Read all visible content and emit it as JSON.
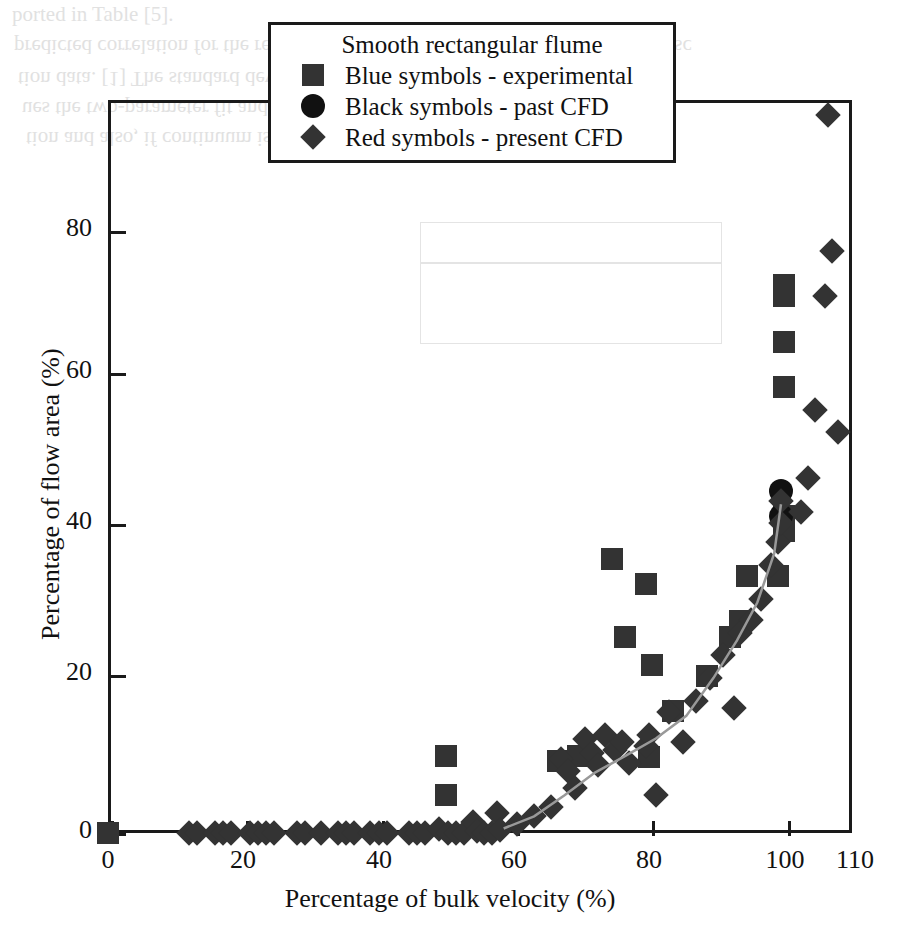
{
  "legend": {
    "title": "Smooth rectangular flume",
    "entries": [
      {
        "marker": "square",
        "label": "Blue symbols - experimental"
      },
      {
        "marker": "circle",
        "label": "Black symbols - past CFD"
      },
      {
        "marker": "diamond",
        "label": "Red symbols - present CFD"
      }
    ]
  },
  "background_text": {
    "line1": "ported in Table [5].",
    "line2": "predicted correlation for the rectangular flume. The nearly close results, albeit sc",
    "line3": "tion data. [1] The standard deviation and the best-fit correlation of the data",
    "line4": "ues the two-parameter fit and the second moment of the sample. Although",
    "line5": "tion and also, if continuum is used, the relative flux rate of the data matrix"
  },
  "chart_data": {
    "type": "scatter",
    "title": "",
    "xlabel": "Percentage of bulk velocity (%)",
    "ylabel": "Percentage of flow area (%)",
    "xlim": [
      0,
      110
    ],
    "ylim": [
      0,
      97
    ],
    "xticks": [
      0,
      20,
      40,
      60,
      80,
      100,
      110
    ],
    "yticks": [
      0,
      20,
      40,
      60,
      80
    ],
    "grid": false,
    "legend_position": "top-center",
    "series": [
      {
        "name": "Blue symbols - experimental",
        "marker": "square",
        "color": "#333333",
        "points": [
          [
            0,
            0
          ],
          [
            50,
            10.2
          ],
          [
            50,
            5.0
          ],
          [
            66.5,
            9.5
          ],
          [
            69.5,
            10.2
          ],
          [
            74.5,
            36.2
          ],
          [
            76.5,
            26.0
          ],
          [
            79.5,
            33.0
          ],
          [
            80.0,
            10.0
          ],
          [
            80.5,
            22.2
          ],
          [
            83.5,
            16.2
          ],
          [
            88.5,
            20.8
          ],
          [
            92.0,
            26.0
          ],
          [
            93.5,
            28.0
          ],
          [
            94.5,
            34.0
          ],
          [
            99.0,
            34.0
          ],
          [
            100.0,
            40.0
          ],
          [
            100.0,
            42.0
          ],
          [
            100.0,
            59.0
          ],
          [
            100.0,
            65.0
          ],
          [
            100.0,
            71.0
          ],
          [
            100.0,
            72.5
          ]
        ]
      },
      {
        "name": "Black symbols - past CFD",
        "marker": "circle",
        "color": "#111111",
        "points": [
          [
            99.5,
            45.2
          ],
          [
            99.5,
            42.0
          ]
        ]
      },
      {
        "name": "Red symbols - present CFD",
        "marker": "diamond",
        "color": "#333333",
        "points": [
          [
            12.0,
            0
          ],
          [
            13.2,
            0
          ],
          [
            15.8,
            0
          ],
          [
            17.0,
            0
          ],
          [
            18.2,
            0
          ],
          [
            21.0,
            0
          ],
          [
            22.2,
            0
          ],
          [
            23.4,
            0
          ],
          [
            24.6,
            0
          ],
          [
            28.0,
            0
          ],
          [
            29.2,
            0
          ],
          [
            31.5,
            0
          ],
          [
            34.0,
            0
          ],
          [
            35.2,
            0
          ],
          [
            36.4,
            0
          ],
          [
            38.8,
            0
          ],
          [
            40.0,
            0
          ],
          [
            41.2,
            0
          ],
          [
            44.5,
            0
          ],
          [
            45.7,
            0
          ],
          [
            46.9,
            0
          ],
          [
            49.0,
            0.5
          ],
          [
            50.2,
            0
          ],
          [
            51.4,
            0
          ],
          [
            52.6,
            0
          ],
          [
            54.0,
            1.5
          ],
          [
            54.5,
            0.3
          ],
          [
            55.6,
            0
          ],
          [
            56.8,
            0
          ],
          [
            57.5,
            2.6
          ],
          [
            58.0,
            0.4
          ],
          [
            60.5,
            1.2
          ],
          [
            63.0,
            2.2
          ],
          [
            65.5,
            3.4
          ],
          [
            67.0,
            9.8
          ],
          [
            68.0,
            8.2
          ],
          [
            69.0,
            6.0
          ],
          [
            70.5,
            12.5
          ],
          [
            71.5,
            10.6
          ],
          [
            72.5,
            9.0
          ],
          [
            73.5,
            13.0
          ],
          [
            75.0,
            11.0
          ],
          [
            76.0,
            12.0
          ],
          [
            77.0,
            9.2
          ],
          [
            79.5,
            11.5
          ],
          [
            80.0,
            13.0
          ],
          [
            81.0,
            5.0
          ],
          [
            83.0,
            16.0
          ],
          [
            85.0,
            12.0
          ],
          [
            87.0,
            17.5
          ],
          [
            89.0,
            20.5
          ],
          [
            91.0,
            23.5
          ],
          [
            92.5,
            16.5
          ],
          [
            93.5,
            26.5
          ],
          [
            95.0,
            28.2
          ],
          [
            96.5,
            31.0
          ],
          [
            98.0,
            35.5
          ],
          [
            99.0,
            38.5
          ],
          [
            99.5,
            41.0
          ],
          [
            99.5,
            44.0
          ],
          [
            102.5,
            42.5
          ],
          [
            103.5,
            47.0
          ],
          [
            104.5,
            56.0
          ],
          [
            106.0,
            71.0
          ],
          [
            106.5,
            95.0
          ],
          [
            107.0,
            77.0
          ],
          [
            108.0,
            53.0
          ]
        ]
      }
    ],
    "trend_line": {
      "name": "present CFD trend",
      "color": "#999999",
      "points": [
        [
          58.5,
          0.6
        ],
        [
          63.0,
          2.2
        ],
        [
          67.5,
          5.0
        ],
        [
          72.0,
          8.0
        ],
        [
          76.5,
          10.2
        ],
        [
          81.0,
          12.5
        ],
        [
          85.5,
          15.5
        ],
        [
          89.5,
          20.5
        ],
        [
          93.0,
          25.5
        ],
        [
          96.0,
          30.5
        ],
        [
          98.5,
          37.0
        ],
        [
          99.5,
          43.5
        ]
      ]
    }
  }
}
